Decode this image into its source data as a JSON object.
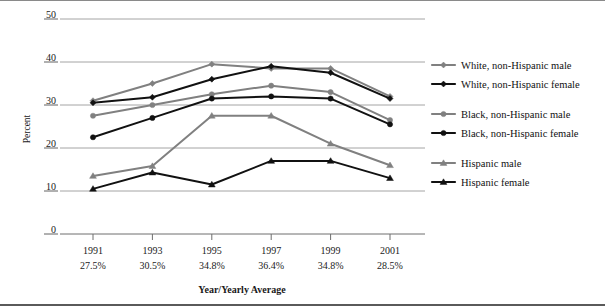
{
  "chart_data": {
    "type": "line",
    "title": "",
    "xlabel": "Year/Yearly Average",
    "ylabel": "Percent",
    "ylim": [
      0,
      50
    ],
    "yticks": [
      0,
      10,
      20,
      30,
      40,
      50
    ],
    "ytick_labels": [
      "0",
      "10",
      "20",
      "30",
      "40",
      "50"
    ],
    "grid": true,
    "legend_position": "right",
    "categories": [
      "1991",
      "1993",
      "1995",
      "1997",
      "1999",
      "2001"
    ],
    "category_sublabels": [
      "27.5%",
      "30.5%",
      "34.8%",
      "36.4%",
      "34.8%",
      "28.5%"
    ],
    "series": [
      {
        "name": "White, non-Hispanic male",
        "marker": "diamond",
        "color": "#808080",
        "values": [
          31.0,
          35.0,
          39.5,
          38.5,
          38.5,
          32.0
        ]
      },
      {
        "name": "White, non-Hispanic female",
        "marker": "diamond",
        "color": "#111111",
        "values": [
          30.5,
          31.8,
          36.0,
          39.0,
          37.5,
          31.5
        ]
      },
      {
        "name": "Black, non-Hispanic male",
        "marker": "circle",
        "color": "#808080",
        "values": [
          27.5,
          30.0,
          32.5,
          34.5,
          33.0,
          26.5
        ]
      },
      {
        "name": "Black, non-Hispanic female",
        "marker": "circle",
        "color": "#111111",
        "values": [
          22.5,
          27.0,
          31.5,
          32.0,
          31.5,
          25.5
        ]
      },
      {
        "name": "Hispanic male",
        "marker": "triangle",
        "color": "#808080",
        "values": [
          13.5,
          15.8,
          27.5,
          27.5,
          21.0,
          16.0
        ]
      },
      {
        "name": "Hispanic female",
        "marker": "triangle",
        "color": "#111111",
        "values": [
          10.5,
          14.3,
          11.5,
          17.0,
          17.0,
          13.0
        ]
      }
    ]
  },
  "axis": {
    "y_title": "Percent",
    "x_title": "Year/Yearly Average"
  },
  "legend": {
    "items": [
      {
        "label": "White, non-Hispanic male"
      },
      {
        "label": "White, non-Hispanic female"
      },
      {
        "label": "Black, non-Hispanic male"
      },
      {
        "label": "Black, non-Hispanic female"
      },
      {
        "label": "Hispanic male"
      },
      {
        "label": "Hispanic female"
      }
    ]
  }
}
